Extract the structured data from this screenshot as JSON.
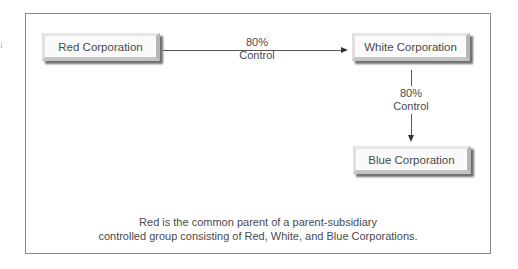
{
  "diagram": {
    "nodes": [
      {
        "id": "red",
        "label": "Red Corporation"
      },
      {
        "id": "white",
        "label": "White Corporation"
      },
      {
        "id": "blue",
        "label": "Blue Corporation"
      }
    ],
    "edges": [
      {
        "from": "red",
        "to": "white",
        "label_line1": "80%",
        "label_line2": "Control"
      },
      {
        "from": "white",
        "to": "blue",
        "label_line1": "80%",
        "label_line2": "Control"
      }
    ],
    "caption_line1": "Red is the common parent of a parent-subsidiary",
    "caption_line2": "controlled group consisting of Red, White, and Blue Corporations."
  }
}
